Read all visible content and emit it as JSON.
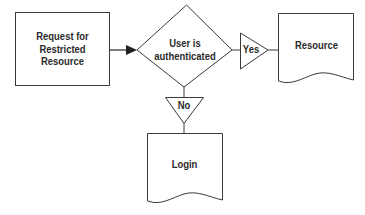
{
  "diagram": {
    "type": "flowchart",
    "colors": {
      "stroke": "#3a3a3a",
      "text": "#2b2b2b",
      "background": "#ffffff"
    },
    "nodes": {
      "request": {
        "shape": "rectangle",
        "line1": "Request for",
        "line2": "Restricted",
        "line3": "Resource"
      },
      "decision": {
        "shape": "diamond",
        "line1": "User is",
        "line2": "authenticated"
      },
      "yes": {
        "shape": "triangle-right",
        "label": "Yes"
      },
      "no": {
        "shape": "triangle-down",
        "label": "No"
      },
      "resource": {
        "shape": "document",
        "label": "Resource"
      },
      "login": {
        "shape": "document",
        "label": "Login"
      }
    },
    "edges": [
      {
        "from": "request",
        "to": "decision",
        "arrow": true
      },
      {
        "from": "decision",
        "to": "yes",
        "arrow": false
      },
      {
        "from": "yes",
        "to": "resource",
        "arrow": false
      },
      {
        "from": "decision",
        "to": "no",
        "arrow": false
      },
      {
        "from": "no",
        "to": "login",
        "arrow": false
      }
    ]
  }
}
